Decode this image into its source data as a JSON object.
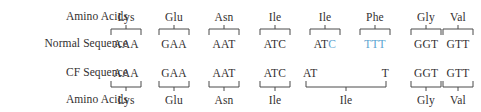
{
  "figure": {
    "title_row_labels": {
      "amino_acids_top": "Amino Acids",
      "normal_sequence": "Normal Sequence",
      "cf_sequence": "CF Sequence",
      "amino_acids_bottom": "Amino Acids"
    },
    "colors": {
      "text": "#333030",
      "deleted_bases": "#5ba3d0",
      "bracket": "#4a4a4a",
      "background": "#ffffff"
    }
  },
  "normal": {
    "amino_acids": [
      "Lys",
      "Glu",
      "Asn",
      "Ile",
      "Ile",
      "Phe",
      "Gly",
      "Val"
    ],
    "codons": [
      {
        "text": "AAA",
        "deleted_part": ""
      },
      {
        "text": "GAA",
        "deleted_part": ""
      },
      {
        "text": "AAT",
        "deleted_part": ""
      },
      {
        "text": "ATC",
        "deleted_part": ""
      },
      {
        "text": "ATC",
        "deleted_part": "C"
      },
      {
        "text": "TTT",
        "deleted_part": "TTT"
      },
      {
        "text": "GGT",
        "deleted_part": ""
      },
      {
        "text": "GTT",
        "deleted_part": ""
      }
    ]
  },
  "cf": {
    "codons": [
      "AAA",
      "GAA",
      "AAT",
      "ATC",
      "AT",
      "T",
      "GGT",
      "GTT"
    ],
    "amino_acids": [
      "Lys",
      "Glu",
      "Asn",
      "Ile",
      "Ile",
      "Gly",
      "Val"
    ],
    "split_codon": {
      "left": "AT",
      "right": "T",
      "amino_acid": "Ile"
    }
  }
}
